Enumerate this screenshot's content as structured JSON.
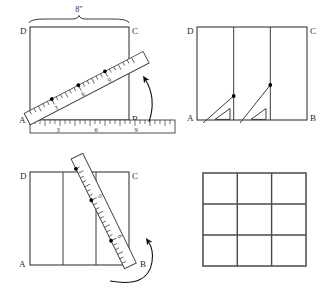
{
  "figure": {
    "dimension_label": "8\"",
    "line_color": "#3a3a3a",
    "accent_color": "#000000"
  },
  "panels": [
    {
      "id": "panel-top-left",
      "name": "square-with-diagonal-ruler",
      "corner_labels": {
        "top_left": "D",
        "top_right": "C",
        "bottom_left": "A",
        "bottom_right": "B"
      },
      "dimension": "8\"",
      "diagonal_ruler": {
        "marks": [
          "3",
          "6",
          "9"
        ],
        "tick_count": 24
      },
      "horizontal_ruler": {
        "marks": [
          "3",
          "6",
          "9"
        ],
        "tick_count": 28
      },
      "rotation_arrow": "curved-arrow-up"
    },
    {
      "id": "panel-top-right",
      "name": "square-with-vertical-divisions-and-set-squares",
      "corner_labels": {
        "top_left": "D",
        "top_right": "C",
        "bottom_left": "A",
        "bottom_right": "B"
      },
      "division_count": 3,
      "set_square_count": 2,
      "marked_points": 2
    },
    {
      "id": "panel-bottom-left",
      "name": "square-with-steep-diagonal-ruler",
      "corner_labels": {
        "top_left": "D",
        "top_right": "C",
        "bottom_left": "A",
        "bottom_right": "B"
      },
      "diagonal_ruler": {
        "marks": [
          "6",
          "9"
        ],
        "tick_count": 22
      },
      "division_count": 3,
      "rotation_arrow": "curved-arrow-up"
    },
    {
      "id": "panel-bottom-right",
      "name": "finished-three-by-three-grid",
      "rows": 3,
      "columns": 3,
      "cell_count": 9
    }
  ]
}
